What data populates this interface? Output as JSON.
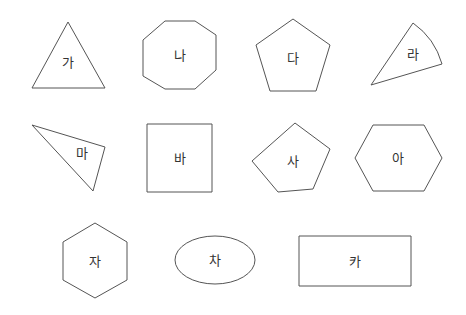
{
  "shapes": [
    {
      "id": "ga",
      "label": "가",
      "type": "triangle",
      "points": "68,22 32,88 105,88",
      "label_pos": [
        68,
        62
      ]
    },
    {
      "id": "na",
      "label": "나",
      "type": "octagon",
      "points": "165,21 195,21 216,35 216,70 195,89 165,89 143,76 143,40",
      "label_pos": [
        180,
        55
      ]
    },
    {
      "id": "da",
      "label": "다",
      "type": "pentagon",
      "points": "293,19 330,45 316,91 270,91 256,45",
      "label_pos": [
        293,
        58
      ]
    },
    {
      "id": "ra",
      "label": "라",
      "type": "sector",
      "label_pos": [
        413,
        54
      ]
    },
    {
      "id": "ma",
      "label": "마",
      "type": "triangle",
      "points": "32,125 105,147 93,191",
      "label_pos": [
        82,
        153
      ]
    },
    {
      "id": "ba",
      "label": "바",
      "type": "square",
      "points": "147,124 212,124 212,192 147,192",
      "label_pos": [
        180,
        158
      ]
    },
    {
      "id": "sa",
      "label": "사",
      "type": "pentagon",
      "points": "295,123 330,149 313,189 278,192 252,161",
      "label_pos": [
        293,
        161
      ]
    },
    {
      "id": "a",
      "label": "아",
      "type": "hexagon",
      "points": "373,125 424,125 442,158 424,191 373,191 355,158",
      "label_pos": [
        398,
        158
      ]
    },
    {
      "id": "ja",
      "label": "자",
      "type": "hexagon",
      "points": "95,223 127,242 127,280 95,298 63,280 63,242",
      "label_pos": [
        95,
        261
      ]
    },
    {
      "id": "cha",
      "label": "차",
      "type": "ellipse",
      "label_pos": [
        215,
        260
      ]
    },
    {
      "id": "ka",
      "label": "카",
      "type": "rectangle",
      "points": "299,236 411,236 411,286 299,286",
      "label_pos": [
        355,
        261
      ]
    }
  ],
  "colors": {
    "stroke": "#555555",
    "text": "#333333",
    "background": "#ffffff"
  }
}
